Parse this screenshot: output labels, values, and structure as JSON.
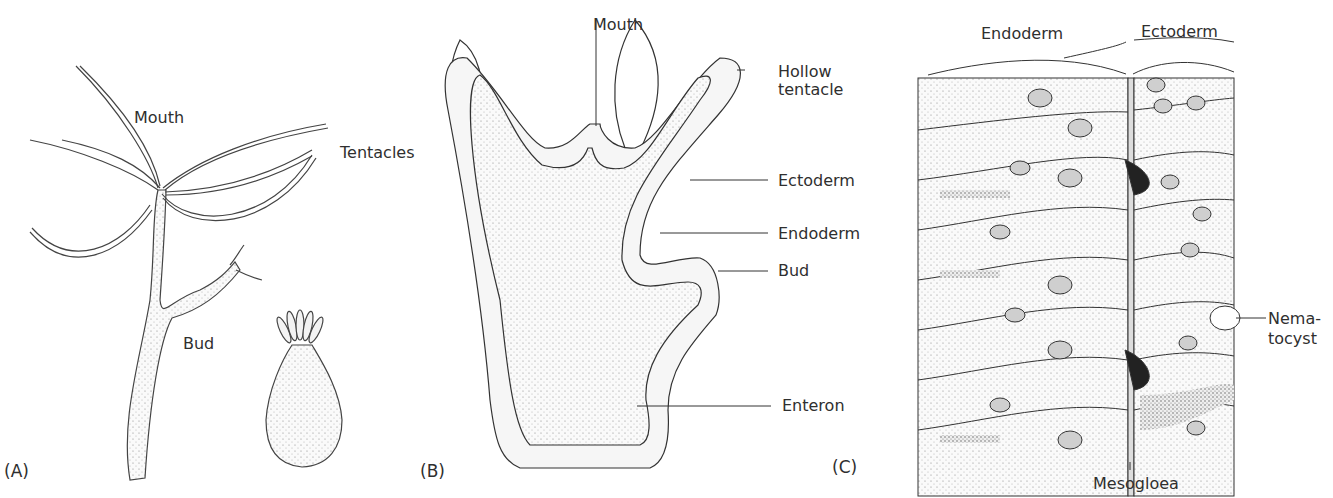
{
  "panels": [
    {
      "id": "A",
      "label": "(A)",
      "title": "Hydra whole organism",
      "callouts": {
        "mouth": "Mouth",
        "tentacles": "Tentacles",
        "bud": "Bud"
      }
    },
    {
      "id": "B",
      "label": "(B)",
      "title": "Contracted hydra"
    },
    {
      "id": "C_section",
      "title": "Longitudinal section",
      "callouts": {
        "mouth": "Mouth",
        "hollow_tentacle_line1": "Hollow",
        "hollow_tentacle_line2": "tentacle",
        "ectoderm": "Ectoderm",
        "endoderm": "Endoderm",
        "bud": "Bud",
        "enteron": "Enteron"
      }
    },
    {
      "id": "C",
      "label": "(C)",
      "title": "Body wall detail",
      "callouts": {
        "endoderm": "Endoderm",
        "ectoderm": "Ectoderm",
        "nematocyst_line1": "Nema-",
        "nematocyst_line2": "tocyst",
        "mesogloea": "Mesogloea"
      }
    }
  ],
  "colors": {
    "ink": "#2f2f2f",
    "stipple": "#f1f1f1",
    "background": "#ffffff"
  }
}
